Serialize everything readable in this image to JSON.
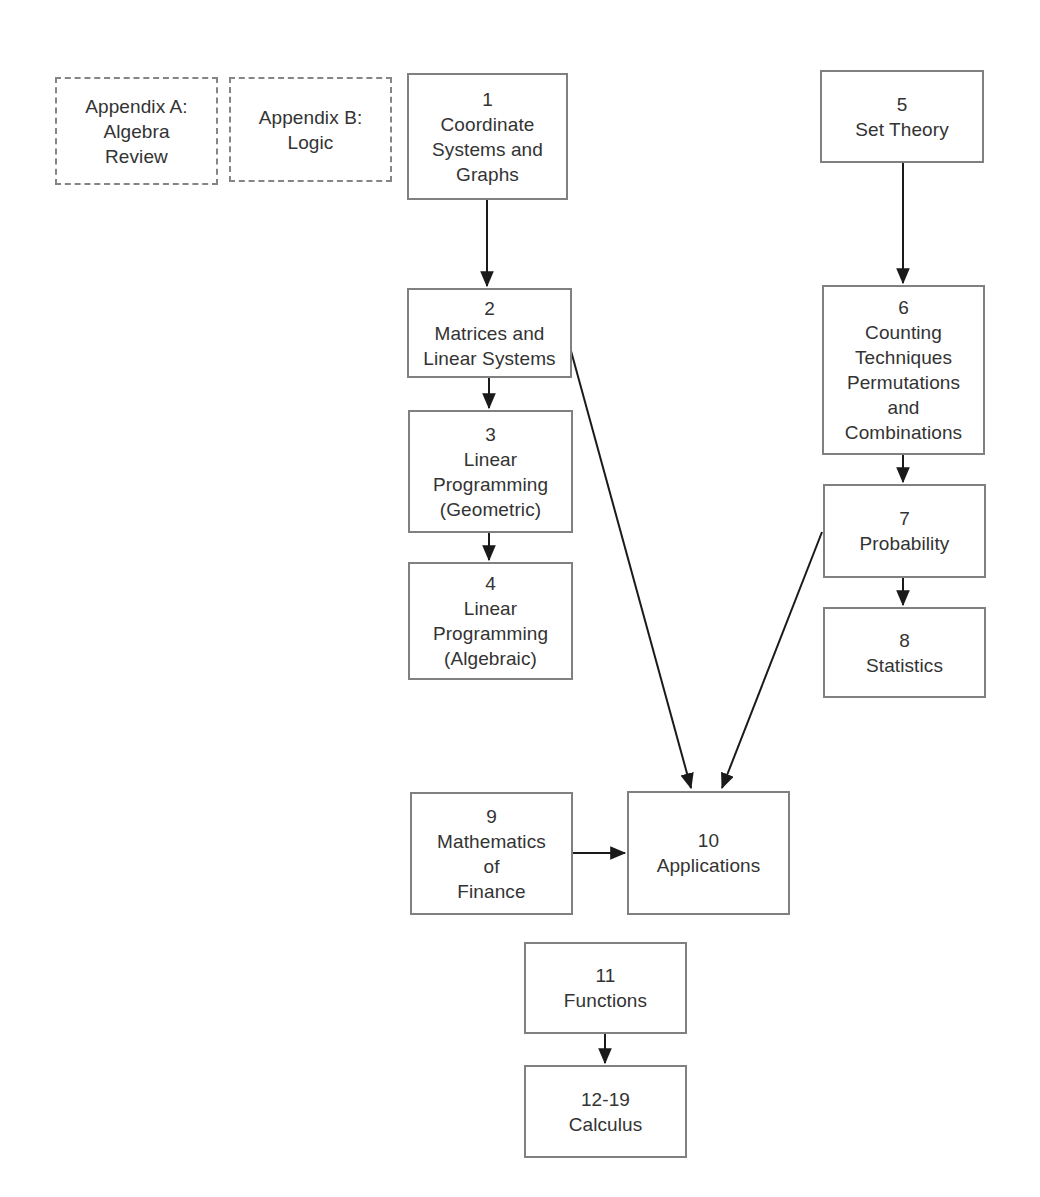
{
  "diagram": {
    "background_color": "#ffffff",
    "box_border_color": "#808080",
    "dashed_border_color": "#858585",
    "text_color": "#333333",
    "edge_color": "#1a1a1a",
    "nodes": [
      {
        "id": "appendix-a",
        "number": "",
        "label": "Appendix A:\nAlgebra\nReview",
        "style": "dashed",
        "x": 55,
        "y": 77,
        "w": 163,
        "h": 108
      },
      {
        "id": "appendix-b",
        "number": "",
        "label": "Appendix B:\nLogic",
        "style": "dashed",
        "x": 229,
        "y": 77,
        "w": 163,
        "h": 105
      },
      {
        "id": "ch1",
        "number": "1",
        "label": "1\nCoordinate\nSystems and\nGraphs",
        "style": "solid",
        "x": 407,
        "y": 73,
        "w": 161,
        "h": 127
      },
      {
        "id": "ch5",
        "number": "5",
        "label": "5\nSet Theory",
        "style": "solid",
        "x": 820,
        "y": 70,
        "w": 164,
        "h": 93
      },
      {
        "id": "ch2",
        "number": "2",
        "label": "2\nMatrices and\nLinear Systems",
        "style": "solid",
        "x": 407,
        "y": 288,
        "w": 165,
        "h": 90
      },
      {
        "id": "ch6",
        "number": "6",
        "label": "6\nCounting\nTechniques\nPermutations\nand\nCombinations",
        "style": "solid",
        "x": 822,
        "y": 285,
        "w": 163,
        "h": 170
      },
      {
        "id": "ch3",
        "number": "3",
        "label": "3\nLinear\nProgramming\n(Geometric)",
        "style": "solid",
        "x": 408,
        "y": 410,
        "w": 165,
        "h": 123
      },
      {
        "id": "ch7",
        "number": "7",
        "label": "7\nProbability",
        "style": "solid",
        "x": 823,
        "y": 484,
        "w": 163,
        "h": 94
      },
      {
        "id": "ch4",
        "number": "4",
        "label": "4\nLinear\nProgramming\n(Algebraic)",
        "style": "solid",
        "x": 408,
        "y": 562,
        "w": 165,
        "h": 118
      },
      {
        "id": "ch8",
        "number": "8",
        "label": "8\nStatistics",
        "style": "solid",
        "x": 823,
        "y": 607,
        "w": 163,
        "h": 91
      },
      {
        "id": "ch9",
        "number": "9",
        "label": "9\nMathematics\nof\nFinance",
        "style": "solid",
        "x": 410,
        "y": 792,
        "w": 163,
        "h": 123
      },
      {
        "id": "ch10",
        "number": "10",
        "label": "10\nApplications",
        "style": "solid",
        "x": 627,
        "y": 791,
        "w": 163,
        "h": 124
      },
      {
        "id": "ch11",
        "number": "11",
        "label": "11\nFunctions",
        "style": "solid",
        "x": 524,
        "y": 942,
        "w": 163,
        "h": 92
      },
      {
        "id": "ch12-19",
        "number": "12-19",
        "label": "12-19\nCalculus",
        "style": "solid",
        "x": 524,
        "y": 1065,
        "w": 163,
        "h": 93
      }
    ],
    "edges": [
      {
        "id": "ch1-to-ch2",
        "from": "ch1",
        "to": "ch2",
        "x1": 487,
        "y1": 200,
        "x2": 487,
        "y2": 286
      },
      {
        "id": "ch5-to-ch6",
        "from": "ch5",
        "to": "ch6",
        "x1": 903,
        "y1": 163,
        "x2": 903,
        "y2": 283
      },
      {
        "id": "ch2-to-ch3",
        "from": "ch2",
        "to": "ch3",
        "x1": 489,
        "y1": 378,
        "x2": 489,
        "y2": 408
      },
      {
        "id": "ch3-to-ch4",
        "from": "ch3",
        "to": "ch4",
        "x1": 489,
        "y1": 533,
        "x2": 489,
        "y2": 560
      },
      {
        "id": "ch6-to-ch7",
        "from": "ch6",
        "to": "ch7",
        "x1": 903,
        "y1": 455,
        "x2": 903,
        "y2": 482
      },
      {
        "id": "ch7-to-ch8",
        "from": "ch7",
        "to": "ch8",
        "x1": 903,
        "y1": 578,
        "x2": 903,
        "y2": 605
      },
      {
        "id": "ch2-to-ch10",
        "from": "ch2",
        "to": "ch10",
        "x1": 568,
        "y1": 340,
        "x2": 691,
        "y2": 788
      },
      {
        "id": "ch7-to-ch10",
        "from": "ch7",
        "to": "ch10",
        "x1": 822,
        "y1": 532,
        "x2": 722,
        "y2": 788
      },
      {
        "id": "ch9-to-ch10",
        "from": "ch9",
        "to": "ch10",
        "x1": 573,
        "y1": 853,
        "x2": 625,
        "y2": 853
      },
      {
        "id": "ch11-to-ch12",
        "from": "ch11",
        "to": "ch12-19",
        "x1": 605,
        "y1": 1034,
        "x2": 605,
        "y2": 1063
      }
    ]
  }
}
